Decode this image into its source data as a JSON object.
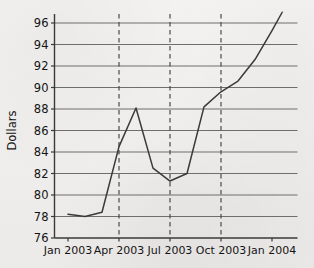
{
  "chart_data": {
    "type": "line",
    "title": "",
    "xlabel": "",
    "ylabel": "Dollars",
    "ylim": [
      76,
      96
    ],
    "ytick_labels": [
      "76",
      "78",
      "80",
      "82",
      "84",
      "86",
      "88",
      "90",
      "92",
      "94",
      "96"
    ],
    "yticks": [
      76,
      78,
      80,
      82,
      84,
      86,
      88,
      90,
      92,
      94,
      96
    ],
    "xtick_labels": [
      "Jan 2003",
      "Apr 2003",
      "Jul 2003",
      "Oct 2003",
      "Jan 2004"
    ],
    "xticks": [
      0,
      3,
      6,
      9,
      12
    ],
    "grid": "horizontal",
    "legend": "none",
    "vertical_markers": [
      3,
      6,
      9
    ],
    "vertical_marker_style": "dashed",
    "x": [
      0,
      1,
      2,
      3,
      4,
      5,
      6,
      7,
      8,
      9,
      10,
      11,
      12,
      12.6
    ],
    "values": [
      78.2,
      78.0,
      78.4,
      84.5,
      88.1,
      82.5,
      81.3,
      82.0,
      88.2,
      89.6,
      90.6,
      92.6,
      95.3,
      97.0
    ],
    "series": [
      {
        "name": "Dollars",
        "x": [
          0,
          1,
          2,
          3,
          4,
          5,
          6,
          7,
          8,
          9,
          10,
          11,
          12,
          12.6
        ],
        "values": [
          78.2,
          78.0,
          78.4,
          84.5,
          88.1,
          82.5,
          81.3,
          82.0,
          88.2,
          89.6,
          90.6,
          92.6,
          95.3,
          97.0
        ]
      }
    ],
    "line_color": "#3a3a3a",
    "grid_color": "#6e6e6e",
    "axis_color": "#3a3a3a",
    "background_color": "#f2f1ef"
  }
}
